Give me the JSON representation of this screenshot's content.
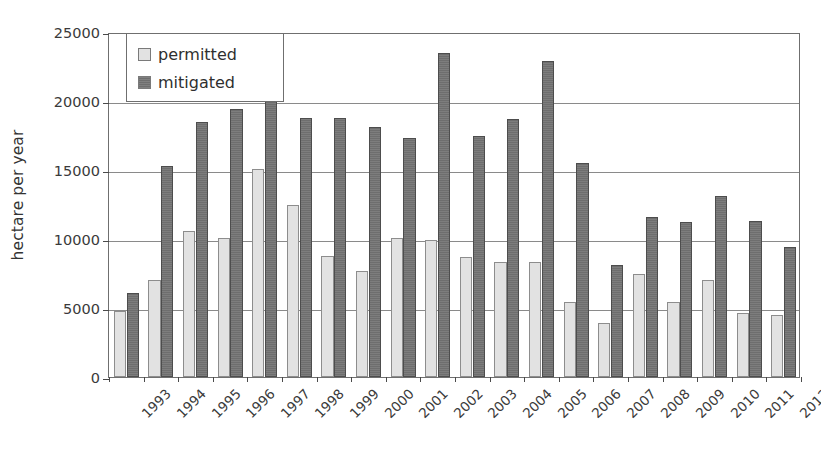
{
  "chart_data": {
    "type": "bar",
    "title": "",
    "subtitle": "",
    "xlabel": "",
    "ylabel": "hectare per year",
    "ylim": [
      0,
      25000
    ],
    "yticks": [
      0,
      5000,
      10000,
      15000,
      20000,
      25000
    ],
    "ytick_labels": [
      "0",
      "5000",
      "10000",
      "15000",
      "20000",
      "25000"
    ],
    "grid": true,
    "legend_position": "top-left",
    "categories": [
      "1993",
      "1994",
      "1995",
      "1996",
      "1997",
      "1998",
      "1999",
      "2000",
      "2001",
      "2002",
      "2003",
      "2004",
      "2005",
      "2006",
      "2007",
      "2008",
      "2009",
      "2010",
      "2011",
      "2012"
    ],
    "series": [
      {
        "name": "permitted",
        "color": "#e2e2e2",
        "values": [
          4800,
          7000,
          10600,
          10100,
          15100,
          12500,
          8800,
          7700,
          10100,
          9950,
          8700,
          8300,
          8300,
          5400,
          3950,
          7500,
          5400,
          7000,
          4650,
          4500
        ]
      },
      {
        "name": "mitigated",
        "color": "#6e6e6e",
        "values": [
          6100,
          15300,
          18500,
          19400,
          21500,
          18800,
          18800,
          18100,
          17300,
          23500,
          17500,
          18700,
          22900,
          15500,
          8100,
          11600,
          11200,
          13100,
          11300,
          9400
        ]
      }
    ]
  },
  "legend": {
    "items": [
      {
        "label": "permitted",
        "swatch": "light-gray-square"
      },
      {
        "label": "mitigated",
        "swatch": "dark-gray-square"
      }
    ]
  },
  "axes": {
    "y_title": "hectare per year"
  }
}
